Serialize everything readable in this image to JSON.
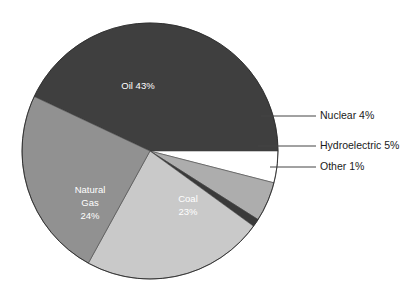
{
  "chart_data": {
    "type": "pie",
    "title": "",
    "subtitle": "",
    "xlabel": "",
    "ylabel": "",
    "legend_position": "callout-right",
    "grid": false,
    "total_percent": 100,
    "categories": [
      "Oil",
      "Nuclear",
      "Hydroelectric",
      "Other",
      "Coal",
      "Natural Gas"
    ],
    "values": [
      43,
      4,
      5,
      1,
      23,
      24
    ],
    "slices": [
      {
        "name": "Oil",
        "value": 43,
        "percent_text": "43%",
        "label_text": "Oil 43%",
        "label_lines": [
          "Oil 43%"
        ],
        "label_placement": "inside",
        "color": "#3f3f3f",
        "label_color": "#ffffff",
        "start_angle_deg": 0,
        "end_angle_deg": 154.8
      },
      {
        "name": "Nuclear",
        "value": 4,
        "percent_text": "4%",
        "label_text": "Nuclear 4%",
        "label_lines": [
          "Nuclear 4%"
        ],
        "label_placement": "callout",
        "color": "#ffffff",
        "label_color": "#1a1a1a",
        "start_angle_deg": 345.6,
        "end_angle_deg": 360
      },
      {
        "name": "Hydroelectric",
        "value": 5,
        "percent_text": "5%",
        "label_text": "Hydroelectric 5%",
        "label_lines": [
          "Hydroelectric 5%"
        ],
        "label_placement": "callout",
        "color": "#adadad",
        "label_color": "#1a1a1a",
        "start_angle_deg": 327.6,
        "end_angle_deg": 345.6
      },
      {
        "name": "Other",
        "value": 1,
        "percent_text": "1%",
        "label_text": "Other 1%",
        "label_lines": [
          "Other 1%"
        ],
        "label_placement": "callout",
        "color": "#3a3a3a",
        "label_color": "#1a1a1a",
        "start_angle_deg": 324,
        "end_angle_deg": 327.6
      },
      {
        "name": "Coal",
        "value": 23,
        "percent_text": "23%",
        "label_text": "Coal 23%",
        "label_lines": [
          "Coal",
          "23%"
        ],
        "label_placement": "inside",
        "color": "#c9c9c9",
        "label_color": "#ffffff",
        "start_angle_deg": 241.2,
        "end_angle_deg": 324
      },
      {
        "name": "Natural Gas",
        "value": 24,
        "percent_text": "24%",
        "label_text": "Natural Gas 24%",
        "label_lines": [
          "Natural",
          "Gas",
          "24%"
        ],
        "label_placement": "inside",
        "color": "#919191",
        "label_color": "#ffffff",
        "start_angle_deg": 154.8,
        "end_angle_deg": 241.2
      }
    ]
  },
  "labels": {
    "oil_line1": "Oil 43%",
    "coal_line1": "Coal",
    "coal_line2": "23%",
    "gas_line1": "Natural",
    "gas_line2": "Gas",
    "gas_line3": "24%",
    "nuclear": "Nuclear 4%",
    "hydroelectric": "Hydroelectric 5%",
    "other": "Other 1%"
  },
  "colors": {
    "background": "#ffffff",
    "oil": "#3f3f3f",
    "natural_gas": "#919191",
    "coal": "#c9c9c9",
    "hydroelectric": "#adadad",
    "nuclear": "#ffffff",
    "other": "#3a3a3a",
    "leader_line": "#444444",
    "callout_text": "#1a1a1a",
    "inside_text": "#ffffff"
  }
}
